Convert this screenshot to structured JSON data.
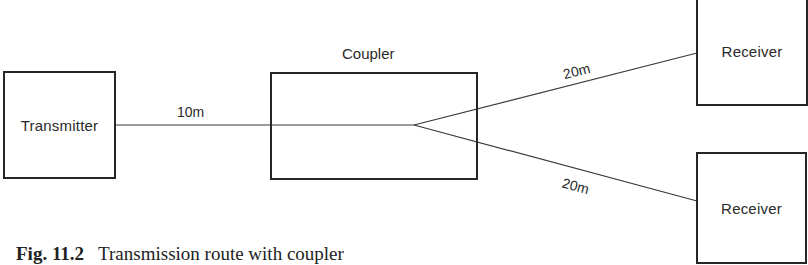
{
  "diagram": {
    "nodes": {
      "transmitter": {
        "label": "Transmitter"
      },
      "coupler": {
        "label": "Coupler"
      },
      "receiver_top": {
        "label": "Receiver"
      },
      "receiver_bottom": {
        "label": "Receiver"
      }
    },
    "edges": {
      "transmitter_to_coupler": {
        "label": "10m"
      },
      "coupler_to_receiver_top": {
        "label": "20m"
      },
      "coupler_to_receiver_bottom": {
        "label": "20m"
      }
    },
    "colors": {
      "stroke": "#262626",
      "text": "#2a2a2a",
      "background": "#ffffff"
    }
  },
  "caption": {
    "figure_number": "Fig. 11.2",
    "text": "Transmission route with coupler"
  }
}
